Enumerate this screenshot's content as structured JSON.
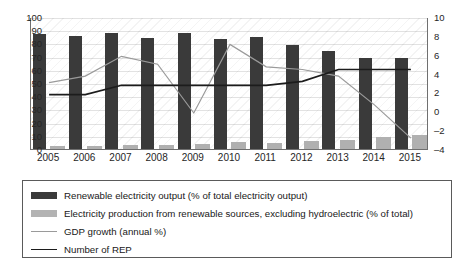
{
  "chart_data": {
    "type": "bar",
    "title": "",
    "subtitle": "",
    "xlabel": "",
    "ylabel": "",
    "categories": [
      "2005",
      "2006",
      "2007",
      "2008",
      "2009",
      "2010",
      "2011",
      "2012",
      "2013",
      "2014",
      "2015"
    ],
    "axes": {
      "left": {
        "label": "",
        "ticks": [
          0,
          10,
          20,
          30,
          40,
          50,
          60,
          70,
          80,
          90,
          100
        ],
        "ylim": [
          0,
          100
        ]
      },
      "right": {
        "label": "",
        "ticks": [
          -4,
          -2,
          0,
          2,
          4,
          6,
          8,
          10
        ],
        "ylim": [
          -4,
          10
        ]
      }
    },
    "grid": true,
    "legend_position": "bottom",
    "series": [
      {
        "name": "Renewable electricity output (% of total electricity output)",
        "type": "bar",
        "axis": "left",
        "color": "#3a3a3a",
        "values": [
          87,
          86,
          88,
          84,
          88,
          83,
          85,
          79,
          74,
          69,
          69
        ]
      },
      {
        "name": "Electricity production from renewable sources, excluding hydroelectric (% of total)",
        "type": "bar",
        "axis": "left",
        "color": "#b0b0b0",
        "values": [
          2,
          2,
          3,
          3,
          3.5,
          5,
          4.5,
          6,
          7,
          9,
          11
        ]
      },
      {
        "name": "GDP growth (annual %)",
        "type": "line",
        "axis": "left",
        "color": "#9a9a9a",
        "values": [
          51,
          56,
          71,
          65,
          28,
          80,
          63,
          61,
          56,
          34,
          9
        ]
      },
      {
        "name": "Number of REP",
        "type": "line",
        "axis": "left",
        "color": "#1c1c1c",
        "values": [
          42,
          42,
          49,
          49,
          49,
          49,
          49,
          52,
          61,
          61,
          61
        ]
      }
    ]
  },
  "legend": {
    "items": [
      {
        "label": "Renewable electricity output (% of total electricity output)",
        "marker": "bar-dark"
      },
      {
        "label": "Electricity production from renewable sources, excluding hydroelectric (% of total)",
        "marker": "bar-light"
      },
      {
        "label": "GDP growth (annual %)",
        "marker": "line-grey"
      },
      {
        "label": "Number of REP",
        "marker": "line-dark"
      }
    ]
  },
  "y_left_ticks": [
    "100",
    "90",
    "80",
    "70",
    "60",
    "50",
    "40",
    "30",
    "20",
    "10",
    "0"
  ],
  "y_right_ticks": [
    "10",
    "8",
    "6",
    "4",
    "2",
    "0",
    "–2",
    "–4"
  ],
  "x_ticks": [
    "2005",
    "2006",
    "2007",
    "2008",
    "2009",
    "2010",
    "2011",
    "2012",
    "2013",
    "2014",
    "2015"
  ]
}
